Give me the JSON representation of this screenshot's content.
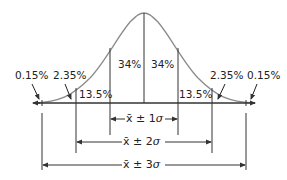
{
  "diagram": {
    "regions": [
      {
        "id": "left-tail",
        "label": "0.15%"
      },
      {
        "id": "left-2to3",
        "label": "2.35%"
      },
      {
        "id": "left-1to2",
        "label": "13.5%"
      },
      {
        "id": "left-0to1",
        "label": "34%"
      },
      {
        "id": "right-0to1",
        "label": "34%"
      },
      {
        "id": "right-1to2",
        "label": "13.5%"
      },
      {
        "id": "right-2to3",
        "label": "2.35%"
      },
      {
        "id": "right-tail",
        "label": "0.15%"
      }
    ],
    "ranges": [
      {
        "id": "one-sigma",
        "prefix": "x̄ ± 1",
        "symbol": "σ"
      },
      {
        "id": "two-sigma",
        "prefix": "x̄ ± 2",
        "symbol": "σ"
      },
      {
        "id": "three-sigma",
        "prefix": "x̄ ± 3",
        "symbol": "σ"
      }
    ],
    "colors": {
      "curve": "#8a8a8a",
      "lines": "#333333",
      "text": "#222222"
    }
  }
}
